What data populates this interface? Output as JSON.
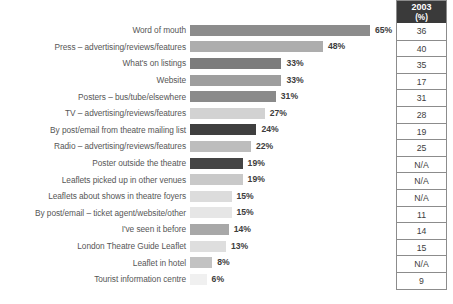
{
  "chart_data": {
    "type": "bar",
    "orientation": "horizontal",
    "title": "",
    "subtitle": "",
    "xlabel": "",
    "ylabel": "",
    "xlim": [
      0,
      65
    ],
    "grid": false,
    "legend": null,
    "value_suffix": "%",
    "categories": [
      "Word of mouth",
      "Press – advertising/reviews/features",
      "What's on listings",
      "Website",
      "Posters – bus/tube/elsewhere",
      "TV – advertising/reviews/features",
      "By post/email from theatre mailing list",
      "Radio – advertising/reviews/features",
      "Poster outside the theatre",
      "Leaflets picked up in other venues",
      "Leaflets about shows in theatre foyers",
      "By post/email – ticket agent/website/other",
      "I've seen it before",
      "London Theatre Guide Leaflet",
      "Leaflet in hotel",
      "Tourist information centre"
    ],
    "values": [
      65,
      48,
      33,
      33,
      31,
      27,
      24,
      22,
      19,
      19,
      15,
      15,
      14,
      13,
      8,
      6
    ],
    "value_labels": [
      "65%",
      "48%",
      "33%",
      "33%",
      "31%",
      "27%",
      "24%",
      "22%",
      "19%",
      "19%",
      "15%",
      "15%",
      "14%",
      "13%",
      "8%",
      "6%"
    ],
    "bar_colors": [
      "#8c8c8c",
      "#adadad",
      "#7c7c7c",
      "#9e9e9e",
      "#8a8a8a",
      "#d2d2d2",
      "#3f3f3f",
      "#bdbdbd",
      "#454545",
      "#c9c9c9",
      "#dcdcdc",
      "#e6e6e6",
      "#a8a8a8",
      "#dedede",
      "#c2c2c2",
      "#f0f0f0"
    ],
    "series": [
      {
        "name": "2003 (%)",
        "display": "table-column",
        "values": [
          "36",
          "40",
          "35",
          "17",
          "31",
          "28",
          "19",
          "25",
          "N/A",
          "N/A",
          "N/A",
          "11",
          "14",
          "15",
          "N/A",
          "9"
        ]
      }
    ]
  },
  "side_table": {
    "header_year": "2003",
    "header_unit": "(%)",
    "header_bg": "#3a3a3a",
    "header_color": "#ffffff"
  }
}
